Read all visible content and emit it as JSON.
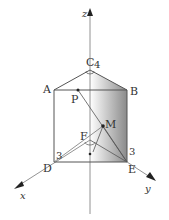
{
  "diagram": {
    "type": "3d-geometry",
    "axes": {
      "x": {
        "label": "x"
      },
      "y": {
        "label": "y"
      },
      "z": {
        "label": "z"
      }
    },
    "points": {
      "A": {
        "label": "A"
      },
      "B": {
        "label": "B"
      },
      "C": {
        "label": "C"
      },
      "D": {
        "label": "D"
      },
      "E": {
        "label": "E"
      },
      "F": {
        "label": "F"
      },
      "M": {
        "label": "M"
      },
      "P": {
        "label": "P"
      }
    },
    "measurements": {
      "C_height": "4",
      "D_length": "3",
      "E_length": "3"
    },
    "colors": {
      "line": "#555555",
      "axis": "#777777",
      "shade_dark": "#8a8a8a",
      "shade_light": "#ffffff"
    }
  }
}
